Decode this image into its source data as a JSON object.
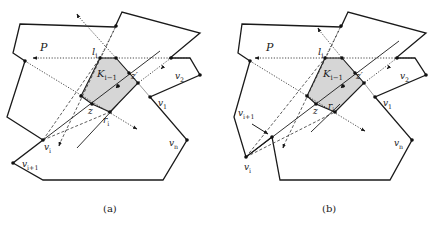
{
  "figure": {
    "panels": [
      {
        "id": "a",
        "caption": "(a)",
        "caption_pos": [
          103,
          212
        ],
        "polygon": [
          [
            20,
            24
          ],
          [
            115,
            27
          ],
          [
            122,
            12
          ],
          [
            200,
            33
          ],
          [
            170,
            58
          ],
          [
            190,
            58
          ],
          [
            200,
            75
          ],
          [
            150,
            97
          ],
          [
            187,
            140
          ],
          [
            163,
            180
          ],
          [
            43,
            180
          ],
          [
            13,
            163
          ],
          [
            43,
            140
          ],
          [
            7,
            117
          ],
          [
            25,
            61
          ],
          [
            13,
            53
          ]
        ],
        "kernel": [
          [
            100,
            58
          ],
          [
            116,
            58
          ],
          [
            138,
            83
          ],
          [
            110,
            112
          ],
          [
            92,
            104
          ],
          [
            81,
            96
          ]
        ],
        "solid_lines": [
          [
            [
              43,
              140
            ],
            [
              160,
              51
            ]
          ],
          [
            [
              77,
              148
            ],
            [
              118,
              104
            ]
          ]
        ],
        "dotted_lines": [
          [
            [
              190,
              58
            ],
            [
              35,
              58
            ]
          ],
          [
            [
              25,
              61
            ],
            [
              135,
              128
            ]
          ],
          [
            [
              78,
              16
            ],
            [
              116,
              58
            ]
          ],
          [
            [
              116,
              26
            ],
            [
              100,
              58
            ]
          ],
          [
            [
              171,
              58
            ],
            [
              138,
              83
            ]
          ]
        ],
        "dashed_lines": [
          [
            [
              43,
              140
            ],
            [
              100,
              58
            ]
          ],
          [
            [
              43,
              140
            ],
            [
              110,
              112
            ]
          ],
          [
            [
              116,
              26
            ],
            [
              60,
              143
            ]
          ]
        ],
        "thin_lines": [
          [
            [
              138,
              83
            ],
            [
              150,
              97
            ]
          ]
        ],
        "arrows": [
          [
            [
              35,
              58
            ],
            [
              33,
              58
            ]
          ],
          [
            [
              135,
              128
            ],
            [
              137,
              129
            ]
          ],
          [
            [
              78,
              16
            ],
            [
              77,
              14
            ]
          ],
          [
            [
              60,
              143
            ],
            [
              59,
              146
            ]
          ],
          [
            [
              118,
              86
            ],
            [
              116,
              88
            ]
          ],
          [
            [
              163,
              67
            ],
            [
              161,
              69
            ]
          ]
        ],
        "points": [
          [
            100,
            58
          ],
          [
            116,
            58
          ],
          [
            25,
            61
          ],
          [
            81,
            96
          ],
          [
            92,
            104
          ],
          [
            110,
            112
          ],
          [
            129,
            73
          ],
          [
            138,
            83
          ],
          [
            116,
            26
          ],
          [
            171,
            58
          ],
          [
            200,
            75
          ],
          [
            150,
            97
          ],
          [
            187,
            140
          ],
          [
            43,
            140
          ],
          [
            13,
            163
          ],
          [
            118,
            86
          ]
        ],
        "labels": [
          {
            "text": "P",
            "x": 40,
            "y": 51,
            "size": 11
          },
          {
            "text": "l",
            "sub": "i",
            "x": 92,
            "y": 55,
            "size": 10
          },
          {
            "text": "K",
            "sub": "i−1",
            "x": 97,
            "y": 77,
            "size": 10
          },
          {
            "text": "z′",
            "x": 131,
            "y": 79,
            "size": 9
          },
          {
            "text": "v",
            "sub": "2",
            "x": 175,
            "y": 79,
            "size": 9
          },
          {
            "text": "v",
            "sub": "1",
            "x": 158,
            "y": 106,
            "size": 9
          },
          {
            "text": "z",
            "x": 88,
            "y": 114,
            "size": 9
          },
          {
            "text": "r",
            "sub": "i",
            "x": 103,
            "y": 123,
            "size": 9
          },
          {
            "text": "v",
            "sub": "n",
            "x": 169,
            "y": 146,
            "size": 9
          },
          {
            "text": "v",
            "sub": "i",
            "x": 44,
            "y": 150,
            "size": 9
          },
          {
            "text": "v",
            "sub": "i+1",
            "x": 22,
            "y": 167,
            "size": 9
          }
        ]
      },
      {
        "id": "b",
        "caption": "(b)",
        "caption_pos": [
          322,
          212
        ],
        "polygon": [
          [
            242,
            24
          ],
          [
            341,
            27
          ],
          [
            348,
            12
          ],
          [
            426,
            33
          ],
          [
            396,
            58
          ],
          [
            415,
            58
          ],
          [
            426,
            75
          ],
          [
            375,
            97
          ],
          [
            412,
            140
          ],
          [
            390,
            180
          ],
          [
            280,
            180
          ],
          [
            272,
            137
          ],
          [
            246,
            157
          ],
          [
            234,
            117
          ],
          [
            250,
            61
          ],
          [
            238,
            53
          ]
        ],
        "kernel": [
          [
            325,
            58
          ],
          [
            342,
            58
          ],
          [
            364,
            83
          ],
          [
            335,
            112
          ],
          [
            316,
            104
          ],
          [
            307,
            96
          ]
        ],
        "solid_lines": [
          [
            [
              246,
              157
            ],
            [
              399,
              41
            ]
          ],
          [
            [
              311,
              132
            ],
            [
              340,
              104
            ]
          ]
        ],
        "dotted_lines": [
          [
            [
              415,
              58
            ],
            [
              257,
              58
            ]
          ],
          [
            [
              250,
              61
            ],
            [
              363,
              130
            ]
          ],
          [
            [
              319,
              30
            ],
            [
              342,
              58
            ]
          ],
          [
            [
              341,
              26
            ],
            [
              325,
              58
            ]
          ],
          [
            [
              397,
              58
            ],
            [
              364,
              83
            ]
          ]
        ],
        "dashed_lines": [
          [
            [
              246,
              157
            ],
            [
              325,
              58
            ]
          ],
          [
            [
              246,
              157
            ],
            [
              335,
              112
            ]
          ],
          [
            [
              341,
              26
            ],
            [
              284,
              145
            ]
          ]
        ],
        "thin_lines": [
          [
            [
              364,
              83
            ],
            [
              375,
              97
            ]
          ]
        ],
        "arrows": [
          [
            [
              257,
              58
            ],
            [
              255,
              58
            ]
          ],
          [
            [
              363,
              130
            ],
            [
              365,
              131
            ]
          ],
          [
            [
              319,
              30
            ],
            [
              318,
              28
            ]
          ],
          [
            [
              284,
              145
            ],
            [
              283,
              148
            ]
          ],
          [
            [
              343,
              86
            ],
            [
              341,
              88
            ]
          ],
          [
            [
              389,
              67
            ],
            [
              387,
              69
            ]
          ]
        ],
        "points": [
          [
            325,
            58
          ],
          [
            342,
            58
          ],
          [
            250,
            61
          ],
          [
            307,
            96
          ],
          [
            316,
            104
          ],
          [
            335,
            112
          ],
          [
            355,
            73
          ],
          [
            364,
            83
          ],
          [
            341,
            26
          ],
          [
            397,
            58
          ],
          [
            426,
            75
          ],
          [
            375,
            97
          ],
          [
            412,
            140
          ],
          [
            246,
            157
          ],
          [
            272,
            137
          ],
          [
            343,
            86
          ]
        ],
        "labels": [
          {
            "text": "P",
            "x": 266,
            "y": 51,
            "size": 11
          },
          {
            "text": "l",
            "sub": "i",
            "x": 318,
            "y": 55,
            "size": 10
          },
          {
            "text": "K",
            "sub": "i−1",
            "x": 323,
            "y": 77,
            "size": 10
          },
          {
            "text": "z′",
            "x": 356,
            "y": 79,
            "size": 9
          },
          {
            "text": "v",
            "sub": "2",
            "x": 400,
            "y": 79,
            "size": 9
          },
          {
            "text": "v",
            "sub": "1",
            "x": 383,
            "y": 106,
            "size": 9
          },
          {
            "text": "z",
            "x": 313,
            "y": 114,
            "size": 9
          },
          {
            "text": "r",
            "sub": "i",
            "x": 328,
            "y": 109,
            "size": 9
          },
          {
            "text": "v",
            "sub": "n",
            "x": 394,
            "y": 146,
            "size": 9
          },
          {
            "text": "v",
            "sub": "i",
            "x": 244,
            "y": 170,
            "size": 9
          },
          {
            "text": "v",
            "sub": "i+1",
            "x": 238,
            "y": 116,
            "size": 9
          }
        ],
        "callout_arrow": [
          [
            252,
            124
          ],
          [
            268,
            134
          ]
        ]
      }
    ]
  }
}
